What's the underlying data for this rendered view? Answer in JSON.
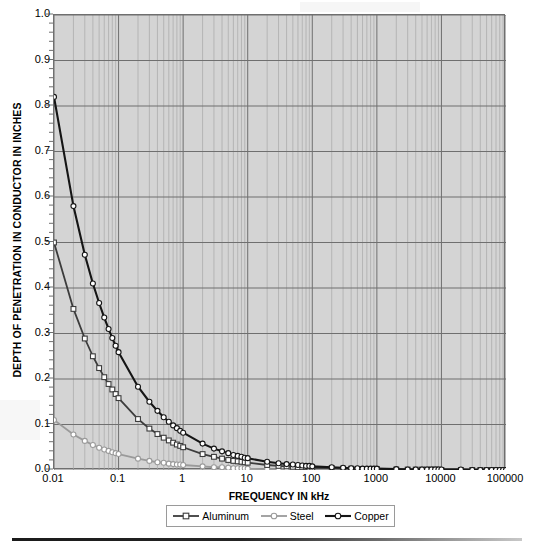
{
  "chart_data": {
    "type": "line",
    "title": "",
    "xlabel": "FREQUENCY IN kHz",
    "ylabel": "DEPTH OF PENETRATION IN CONDUCTOR IN INCHES",
    "xscale": "log",
    "yscale": "linear",
    "xlim": [
      0.01,
      100000
    ],
    "ylim": [
      0.0,
      1.0
    ],
    "grid": true,
    "legend_position": "bottom",
    "x_tick_labels": [
      "0.01",
      "0.1",
      "1",
      "10",
      "100",
      "1000",
      "10000",
      "100000"
    ],
    "x_tick_values": [
      0.01,
      0.1,
      1,
      10,
      100,
      1000,
      10000,
      100000
    ],
    "y_tick_labels": [
      "0.0",
      "0.1",
      "0.2",
      "0.3",
      "0.4",
      "0.5",
      "0.6",
      "0.7",
      "0.8",
      "0.9",
      "1.0"
    ],
    "y_tick_values": [
      0.0,
      0.1,
      0.2,
      0.3,
      0.4,
      0.5,
      0.6,
      0.7,
      0.8,
      0.9,
      1.0
    ],
    "x": [
      0.01,
      0.02,
      0.03,
      0.04,
      0.05,
      0.06,
      0.07,
      0.08,
      0.09,
      0.1,
      0.2,
      0.3,
      0.4,
      0.5,
      0.6,
      0.7,
      0.8,
      0.9,
      1,
      2,
      3,
      4,
      5,
      6,
      7,
      8,
      9,
      10,
      20,
      30,
      40,
      50,
      60,
      70,
      80,
      90,
      100,
      200,
      300,
      400,
      500,
      600,
      700,
      800,
      900,
      1000,
      2000,
      3000,
      4000,
      5000,
      6000,
      7000,
      8000,
      9000,
      10000,
      20000,
      30000,
      40000,
      50000,
      60000,
      70000,
      80000,
      90000,
      100000
    ],
    "series": [
      {
        "name": "Copper",
        "color": "#151515",
        "marker": "circle",
        "line_width": 2.1,
        "values": [
          0.82,
          0.58,
          0.473,
          0.41,
          0.367,
          0.335,
          0.31,
          0.29,
          0.273,
          0.259,
          0.183,
          0.15,
          0.13,
          0.116,
          0.106,
          0.098,
          0.092,
          0.086,
          0.082,
          0.058,
          0.047,
          0.041,
          0.037,
          0.033,
          0.031,
          0.029,
          0.027,
          0.026,
          0.018,
          0.015,
          0.013,
          0.012,
          0.011,
          0.01,
          0.009,
          0.009,
          0.008,
          0.006,
          0.005,
          0.004,
          0.004,
          0.003,
          0.003,
          0.003,
          0.003,
          0.003,
          0.002,
          0.001,
          0.001,
          0.001,
          0.001,
          0.001,
          0.001,
          0.001,
          0.001,
          0.001,
          0.0,
          0.0,
          0.0,
          0.0,
          0.0,
          0.0,
          0.0,
          0.0
        ]
      },
      {
        "name": "Aluminum",
        "color": "#3c3c3c",
        "marker": "square",
        "line_width": 1.8,
        "values": [
          0.5,
          0.354,
          0.289,
          0.25,
          0.224,
          0.204,
          0.189,
          0.177,
          0.167,
          0.158,
          0.112,
          0.091,
          0.079,
          0.071,
          0.065,
          0.06,
          0.056,
          0.053,
          0.05,
          0.035,
          0.029,
          0.025,
          0.022,
          0.02,
          0.019,
          0.018,
          0.017,
          0.016,
          0.011,
          0.009,
          0.008,
          0.007,
          0.006,
          0.006,
          0.006,
          0.005,
          0.005,
          0.004,
          0.003,
          0.003,
          0.002,
          0.002,
          0.002,
          0.002,
          0.002,
          0.002,
          0.001,
          0.001,
          0.001,
          0.001,
          0.001,
          0.001,
          0.001,
          0.001,
          0.0,
          0.0,
          0.0,
          0.0,
          0.0,
          0.0,
          0.0,
          0.0,
          0.0,
          0.0
        ]
      },
      {
        "name": "Steel",
        "color": "#9a9a9a",
        "marker": "circle",
        "line_width": 1.8,
        "values": [
          0.11,
          0.078,
          0.064,
          0.055,
          0.049,
          0.045,
          0.042,
          0.039,
          0.037,
          0.035,
          0.025,
          0.02,
          0.017,
          0.016,
          0.014,
          0.013,
          0.012,
          0.012,
          0.011,
          0.008,
          0.006,
          0.006,
          0.005,
          0.004,
          0.004,
          0.004,
          0.004,
          0.003,
          0.002,
          0.002,
          0.002,
          0.002,
          0.001,
          0.001,
          0.001,
          0.001,
          0.001,
          0.001,
          0.001,
          0.001,
          0.0,
          0.0,
          0.0,
          0.0,
          0.0,
          0.0,
          0.0,
          0.0,
          0.0,
          0.0,
          0.0,
          0.0,
          0.0,
          0.0,
          0.0,
          0.0,
          0.0,
          0.0,
          0.0,
          0.0,
          0.0,
          0.0,
          0.0,
          0.0
        ]
      }
    ]
  },
  "legend": {
    "entries": [
      {
        "label": "Aluminum"
      },
      {
        "label": "Steel"
      },
      {
        "label": "Copper"
      }
    ]
  },
  "axes": {
    "x_title": "FREQUENCY IN kHz",
    "y_title": "DEPTH OF PENETRATION IN CONDUCTOR IN INCHES"
  },
  "colors": {
    "plot_background": "#d4d4d4",
    "major_grid": "#6f6f6f",
    "minor_grid": "#a8a8a8",
    "page_background": "#ffffff"
  }
}
